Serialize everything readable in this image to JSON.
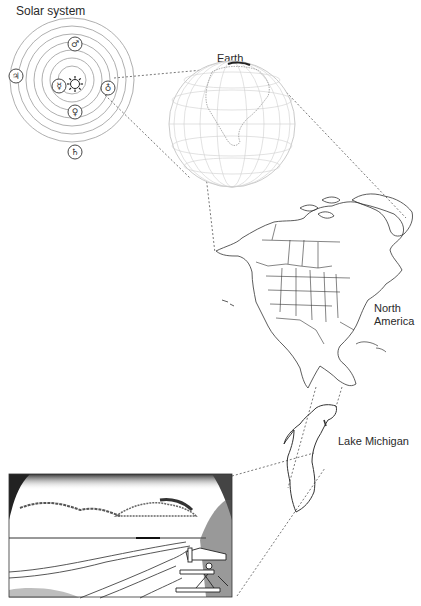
{
  "diagram": {
    "panels": [
      {
        "id": "solar-system",
        "label": "Solar system"
      },
      {
        "id": "earth",
        "label": "Earth"
      },
      {
        "id": "north-america",
        "label_line1": "North",
        "label_line2": "America"
      },
      {
        "id": "lake-michigan",
        "label": "Lake Michigan"
      },
      {
        "id": "beach-scene",
        "label": ""
      }
    ],
    "solar_system": {
      "center": "sun-icon",
      "planet_symbols": [
        {
          "name": "mercury",
          "glyph": "☿"
        },
        {
          "name": "venus",
          "glyph": "♀"
        },
        {
          "name": "earth",
          "glyph": "♁"
        },
        {
          "name": "mars",
          "glyph": "♂"
        },
        {
          "name": "jupiter",
          "glyph": "♃"
        },
        {
          "name": "saturn",
          "glyph": "♄"
        }
      ],
      "sun_glyph": "☼",
      "orbit_count": 6
    },
    "colors": {
      "line": "#333333",
      "orbit": "#9a9a9a",
      "grid": "#c8c8c8",
      "dotted": "#555555"
    }
  }
}
